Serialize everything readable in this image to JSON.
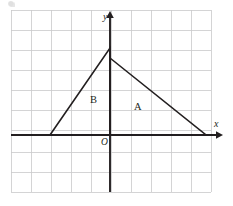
{
  "figure": {
    "kind": "coordinate-grid-diagram",
    "background_color": "#ffffff",
    "ink_color": "#231f20",
    "grid_color": "#c9c9cb"
  },
  "grid": {
    "left": 11,
    "top": 10,
    "right": 211,
    "bottom": 192,
    "cell_size": 20,
    "columns": 10,
    "rows": 9,
    "line_color": "#c9c9cb",
    "line_width": 0.8,
    "visible": true
  },
  "axes": {
    "origin": {
      "x": 110,
      "y": 135
    },
    "color": "#231f20",
    "line_width": 1.9,
    "x_axis": {
      "label": "x",
      "label_style": "italic",
      "start_x": 11,
      "end_x": 222,
      "y": 135,
      "arrow": "right",
      "arrow_tip_x": 222
    },
    "y_axis": {
      "label": "y",
      "label_style": "italic",
      "x": 110,
      "start_y": 192,
      "end_y": 12,
      "arrow": "up",
      "arrow_tip_y": 12
    },
    "origin_label": {
      "text": "O",
      "style": "italic"
    }
  },
  "shapes": [
    {
      "name": "triangle-B",
      "label": "B",
      "label_position": {
        "x": 95,
        "y": 100
      },
      "stroke": "#231f20",
      "stroke_width": 1.6,
      "fill": "none",
      "vertices_px": [
        {
          "x": 50,
          "y": 135
        },
        {
          "x": 110,
          "y": 48
        },
        {
          "x": 110,
          "y": 135
        }
      ],
      "vertices_grid": [
        {
          "x": -3,
          "y": 0
        },
        {
          "x": 0,
          "y": 4.35
        },
        {
          "x": 0,
          "y": 0
        }
      ]
    },
    {
      "name": "triangle-A",
      "label": "A",
      "label_position": {
        "x": 139,
        "y": 107
      },
      "stroke": "#231f20",
      "stroke_width": 1.6,
      "fill": "none",
      "vertices_px": [
        {
          "x": 110,
          "y": 58
        },
        {
          "x": 206,
          "y": 135
        },
        {
          "x": 110,
          "y": 135
        }
      ],
      "vertices_grid": [
        {
          "x": 0,
          "y": 3.85
        },
        {
          "x": 4.8,
          "y": 0
        },
        {
          "x": 0,
          "y": 0
        }
      ]
    }
  ],
  "labels": {
    "y_axis": "y",
    "x_axis": "x",
    "origin": "O",
    "region_a": "A",
    "region_b": "B"
  }
}
